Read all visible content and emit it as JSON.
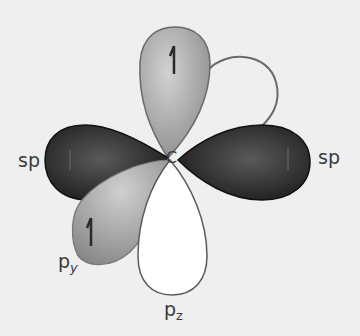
{
  "diagram": {
    "center_atom": "C",
    "orbitals": [
      {
        "id": "sp-left",
        "label": "sp",
        "type": "hybrid",
        "fill": "#2b2b2b",
        "electron": "up-arrow"
      },
      {
        "id": "sp-right",
        "label": "sp",
        "type": "hybrid",
        "fill": "#2b2b2b",
        "electron": "up-arrow"
      },
      {
        "id": "p-top",
        "label": "",
        "type": "p lobe",
        "fill": "#a8a8a8",
        "electron": "up-arrow"
      },
      {
        "id": "p-back",
        "label": "",
        "type": "p lobe outline",
        "fill": "none",
        "electron": ""
      },
      {
        "id": "p-y",
        "label": "p",
        "sub": "y",
        "type": "p lobe",
        "fill": "#9c9c9c",
        "electron": "up-arrow"
      },
      {
        "id": "p-z",
        "label": "p",
        "sub": "z",
        "type": "p lobe",
        "fill": "#ffffff",
        "electron": ""
      }
    ]
  },
  "labels": {
    "sp_left": "sp",
    "sp_right": "sp",
    "carbon": "C",
    "py_main": "p",
    "py_sub": "y",
    "pz_main": "p",
    "pz_sub": "z"
  },
  "colors": {
    "background": "#efefef",
    "sp_lobe": "#2b2b2b",
    "p_top_lobe": "#a8a8a8",
    "p_y_lobe": "#9c9c9c",
    "p_z_lobe": "#ffffff",
    "outline": "#555555"
  }
}
